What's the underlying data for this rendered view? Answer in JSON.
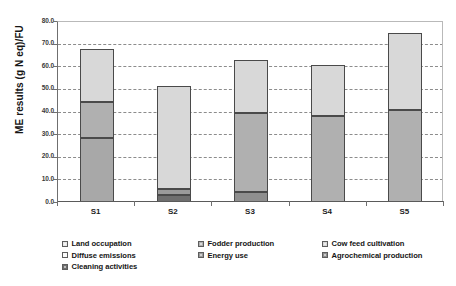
{
  "chart_data": {
    "type": "bar",
    "title": "",
    "xlabel": "",
    "ylabel": "ME results (g N eq)/FU",
    "ylim": [
      0,
      80
    ],
    "ytick_step": 10,
    "ytick_labels": [
      "0.0",
      "10.0",
      "20.0",
      "30.0",
      "40.0",
      "50.0",
      "60.0",
      "70.0",
      "80.0"
    ],
    "grid": true,
    "stacked": true,
    "legend_position": "bottom",
    "categories": [
      "S1",
      "S2",
      "S3",
      "S4",
      "S5"
    ],
    "series": [
      {
        "name": "Cleaning activities",
        "color": "#6e6e6e",
        "values": [
          0.0,
          3.0,
          0.0,
          0.0,
          0.0
        ]
      },
      {
        "name": "Agrochemical production",
        "color": "#8f8f8f",
        "values": [
          0.0,
          0.0,
          4.5,
          0.0,
          0.0
        ]
      },
      {
        "name": "Energy use",
        "color": "#9a9a9a",
        "values": [
          0.0,
          2.8,
          0.0,
          0.0,
          0.0
        ]
      },
      {
        "name": "Diffuse emissions",
        "color": "#a8a8a8",
        "values": [
          28.5,
          0.0,
          0.0,
          0.0,
          0.0
        ]
      },
      {
        "name": "Fodder production",
        "color": "#b0b0b0",
        "values": [
          15.5,
          0.0,
          35.0,
          38.0,
          40.7
        ]
      },
      {
        "name": "Cow feed cultivation",
        "color": "#d8d8d8",
        "values": [
          23.5,
          45.5,
          23.3,
          22.5,
          33.8
        ]
      },
      {
        "name": "Land occupation",
        "color": "#e8e8e8",
        "values": [
          0.0,
          0.0,
          0.0,
          0.0,
          0.0
        ]
      }
    ],
    "totals": [
      67.5,
      51.3,
      62.8,
      60.5,
      74.5
    ],
    "annotations": []
  },
  "axis": {
    "y_title": "ME results (g N eq)/FU",
    "y_ticks": [
      "80.0",
      "70.0",
      "60.0",
      "50.0",
      "40.0",
      "30.0",
      "20.0",
      "10.0",
      "0.0"
    ],
    "x_ticks": [
      "S1",
      "S2",
      "S3",
      "S4",
      "S5"
    ]
  },
  "legend": {
    "rows": [
      [
        {
          "label": "Land occupation",
          "color": "#e8e8e8"
        },
        {
          "label": "Fodder production",
          "color": "#b0b0b0"
        },
        {
          "label": "Cow feed cultivation",
          "color": "#d8d8d8"
        }
      ],
      [
        {
          "label": "Diffuse emissions",
          "color": "#fbfbfb"
        },
        {
          "label": "Energy use",
          "color": "#9a9a9a"
        },
        {
          "label": "Agrochemical production",
          "color": "#8f8f8f"
        }
      ],
      [
        {
          "label": "Cleaning activities",
          "color": "#6e6e6e"
        }
      ]
    ]
  },
  "top_caption": ""
}
